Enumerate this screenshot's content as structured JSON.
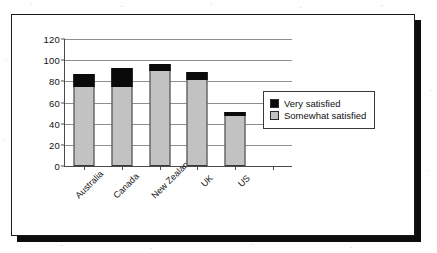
{
  "chart_data": {
    "type": "bar",
    "stacked": true,
    "title": "",
    "xlabel": "",
    "ylabel": "",
    "ylim": [
      0,
      120
    ],
    "ytick_labels": [
      "0",
      "20",
      "40",
      "60",
      "80",
      "100",
      "120"
    ],
    "ytick_values": [
      0,
      20,
      40,
      60,
      80,
      100,
      120
    ],
    "grid": true,
    "legend_position": "right",
    "categories": [
      "Australia",
      "Canada",
      "New Zealand",
      "UK",
      "US"
    ],
    "series": [
      {
        "name": "Somewhat satisfied",
        "color": "#c2c2c2",
        "values": [
          75,
          75,
          90,
          81,
          47
        ]
      },
      {
        "name": "Very satisfied",
        "color": "#0a0a0a",
        "values": [
          12,
          18,
          6,
          8,
          4
        ]
      }
    ],
    "totals": [
      87,
      93,
      96,
      89,
      51
    ]
  },
  "legend": {
    "items": [
      {
        "label": "Very satisfied",
        "swatch": "#0a0a0a"
      },
      {
        "label": "Somewhat satisfied",
        "swatch": "#c2c2c2"
      }
    ]
  }
}
